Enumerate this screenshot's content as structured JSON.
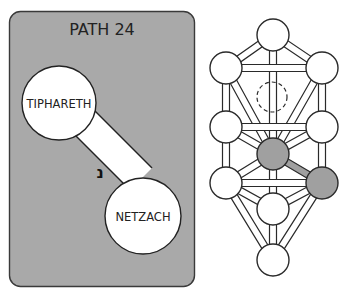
{
  "card": {
    "title": "PATH 24",
    "from_node": "TIPHARETH",
    "to_node": "NETZACH",
    "hebrew_letter": "נ",
    "background": "#a9a9a9"
  },
  "tree": {
    "highlight_color": "#a0a0a0",
    "node_fill": "#ffffff",
    "stroke": "#2a2a2a",
    "nodes": [
      {
        "name": "kether",
        "x": 273,
        "y": 35,
        "dashed": false,
        "highlight": false
      },
      {
        "name": "chokmah",
        "x": 322,
        "y": 68,
        "dashed": false,
        "highlight": false
      },
      {
        "name": "binah",
        "x": 226,
        "y": 68,
        "dashed": false,
        "highlight": false
      },
      {
        "name": "daath",
        "x": 272,
        "y": 97,
        "dashed": true,
        "highlight": false
      },
      {
        "name": "chesed",
        "x": 322,
        "y": 127,
        "dashed": false,
        "highlight": false
      },
      {
        "name": "geburah",
        "x": 226,
        "y": 127,
        "dashed": false,
        "highlight": false
      },
      {
        "name": "tiphareth",
        "x": 273,
        "y": 154,
        "dashed": false,
        "highlight": true
      },
      {
        "name": "netzach",
        "x": 322,
        "y": 183,
        "dashed": false,
        "highlight": true
      },
      {
        "name": "hod",
        "x": 226,
        "y": 183,
        "dashed": false,
        "highlight": false
      },
      {
        "name": "yesod",
        "x": 273,
        "y": 209,
        "dashed": false,
        "highlight": false
      },
      {
        "name": "malkuth",
        "x": 273,
        "y": 260,
        "dashed": false,
        "highlight": false
      }
    ]
  }
}
